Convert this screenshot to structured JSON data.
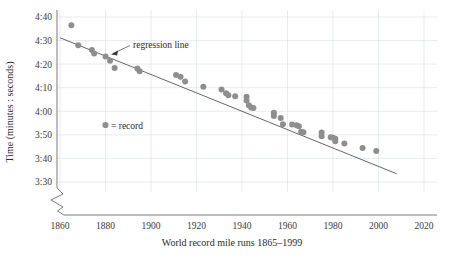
{
  "chart_data": {
    "type": "scatter",
    "title": "",
    "xlabel": "World record mile runs 1865–1999",
    "ylabel": "Time (minutes : seconds)",
    "xlim": [
      1860,
      2020
    ],
    "ylim_seconds": [
      210,
      280
    ],
    "xticks": [
      1860,
      1880,
      1900,
      1920,
      1940,
      1960,
      1980,
      2000,
      2020
    ],
    "ytick_labels": [
      "4:40",
      "4:30",
      "4:20",
      "4:10",
      "4:00",
      "3:50",
      "3:40",
      "3:30"
    ],
    "ytick_seconds": [
      280,
      270,
      260,
      250,
      240,
      230,
      220,
      210
    ],
    "grid": true,
    "legend_position": "inside-left",
    "axis_break": true,
    "series": [
      {
        "name": "record",
        "marker": "circle",
        "color": "#8e8e8e",
        "points": [
          {
            "x": 1865,
            "y": 276.5,
            "label": "4:36.5"
          },
          {
            "x": 1868,
            "y": 268.0,
            "label": "4:28.0"
          },
          {
            "x": 1874,
            "y": 266.0,
            "label": "4:26.0"
          },
          {
            "x": 1875,
            "y": 264.5,
            "label": "4:24.5"
          },
          {
            "x": 1880,
            "y": 263.2,
            "label": "4:23.2"
          },
          {
            "x": 1882,
            "y": 261.4,
            "label": "4:21.4"
          },
          {
            "x": 1884,
            "y": 258.4,
            "label": "4:18.4"
          },
          {
            "x": 1894,
            "y": 258.2,
            "label": "4:18.2"
          },
          {
            "x": 1895,
            "y": 257.0,
            "label": "4:17.0"
          },
          {
            "x": 1911,
            "y": 255.4,
            "label": "4:15.4"
          },
          {
            "x": 1913,
            "y": 254.6,
            "label": "4:14.6"
          },
          {
            "x": 1915,
            "y": 252.6,
            "label": "4:12.6"
          },
          {
            "x": 1923,
            "y": 250.4,
            "label": "4:10.4"
          },
          {
            "x": 1931,
            "y": 249.2,
            "label": "4:09.2"
          },
          {
            "x": 1933,
            "y": 247.6,
            "label": "4:07.6"
          },
          {
            "x": 1934,
            "y": 246.8,
            "label": "4:06.8"
          },
          {
            "x": 1937,
            "y": 246.4,
            "label": "4:06.4"
          },
          {
            "x": 1942,
            "y": 246.2,
            "label": "4:06.2"
          },
          {
            "x": 1942,
            "y": 244.6,
            "label": "4:04.6"
          },
          {
            "x": 1943,
            "y": 242.6,
            "label": "4:02.6"
          },
          {
            "x": 1944,
            "y": 241.6,
            "label": "4:01.6"
          },
          {
            "x": 1945,
            "y": 241.4,
            "label": "4:01.4"
          },
          {
            "x": 1954,
            "y": 239.4,
            "label": "3:59.4"
          },
          {
            "x": 1954,
            "y": 238.0,
            "label": "3:58.0"
          },
          {
            "x": 1957,
            "y": 237.2,
            "label": "3:57.2"
          },
          {
            "x": 1958,
            "y": 234.5,
            "label": "3:54.5"
          },
          {
            "x": 1962,
            "y": 234.4,
            "label": "3:54.4"
          },
          {
            "x": 1964,
            "y": 234.1,
            "label": "3:54.1"
          },
          {
            "x": 1965,
            "y": 233.6,
            "label": "3:53.6"
          },
          {
            "x": 1966,
            "y": 231.3,
            "label": "3:51.3"
          },
          {
            "x": 1967,
            "y": 231.1,
            "label": "3:51.1"
          },
          {
            "x": 1975,
            "y": 231.0,
            "label": "3:51.0"
          },
          {
            "x": 1975,
            "y": 229.4,
            "label": "3:49.4"
          },
          {
            "x": 1979,
            "y": 229.0,
            "label": "3:49.0"
          },
          {
            "x": 1980,
            "y": 228.8,
            "label": "3:48.8"
          },
          {
            "x": 1981,
            "y": 228.4,
            "label": "3:48.4"
          },
          {
            "x": 1981,
            "y": 227.3,
            "label": "3:47.3"
          },
          {
            "x": 1985,
            "y": 226.3,
            "label": "3:46.3"
          },
          {
            "x": 1993,
            "y": 224.4,
            "label": "3:44.4"
          },
          {
            "x": 1999,
            "y": 223.1,
            "label": "3:43.1"
          }
        ]
      }
    ],
    "regression_line": {
      "label": "regression line",
      "x_start": 1860,
      "y_start": 271.2,
      "x_end": 2008,
      "y_end": 213.5
    }
  },
  "legend": {
    "marker_label": "= record"
  },
  "annotation": {
    "regression_label": "regression line"
  }
}
